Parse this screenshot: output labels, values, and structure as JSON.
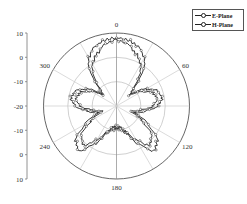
{
  "chart_data": {
    "type": "polar-line",
    "title": "",
    "angular_axis": {
      "direction": "clockwise",
      "zero_location": "top",
      "tick_labels": [
        "0",
        "60",
        "120",
        "180",
        "240",
        "300"
      ],
      "tick_degrees": [
        0,
        60,
        120,
        180,
        240,
        300
      ],
      "spoke_degrees": [
        0,
        30,
        60,
        90,
        120,
        150,
        180,
        210,
        240,
        270,
        300,
        330
      ]
    },
    "radial_axis": {
      "label": "",
      "range": [
        -20,
        10
      ],
      "ring_values": [
        -10,
        0,
        10
      ],
      "left_axis_tick_labels": [
        "10",
        "0",
        "-10",
        "-20",
        "-10",
        "0",
        "10"
      ]
    },
    "legend": {
      "position": "top-right",
      "entries": [
        "E-Plane",
        "H-Plane"
      ]
    },
    "series": [
      {
        "name": "E-Plane",
        "angles_deg": [
          0,
          10,
          20,
          30,
          35,
          40,
          45,
          50,
          60,
          70,
          80,
          90,
          100,
          110,
          120,
          130,
          140,
          150,
          160,
          170,
          180,
          190,
          200,
          210,
          220,
          230,
          240,
          250,
          260,
          270,
          280,
          290,
          300,
          310,
          315,
          320,
          325,
          330,
          340,
          350
        ],
        "values_db": [
          8,
          7.5,
          6,
          3,
          0,
          -5,
          -10,
          -12,
          -6,
          -2,
          -1,
          -3,
          -8,
          -12,
          -5,
          2,
          4,
          -2,
          -8,
          -10,
          -11,
          -10,
          -8,
          -2,
          4,
          2,
          -5,
          -12,
          -8,
          -3,
          -1,
          -2,
          -6,
          -12,
          -10,
          -5,
          0,
          3,
          6,
          7.5
        ]
      },
      {
        "name": "H-Plane",
        "angles_deg": [
          0,
          10,
          20,
          30,
          35,
          40,
          45,
          50,
          60,
          70,
          80,
          90,
          100,
          110,
          120,
          130,
          140,
          150,
          160,
          170,
          180,
          190,
          200,
          210,
          220,
          230,
          240,
          250,
          260,
          270,
          280,
          290,
          300,
          310,
          315,
          320,
          325,
          330,
          340,
          350
        ],
        "values_db": [
          7,
          6,
          3,
          0,
          -3,
          -7,
          -11,
          -13,
          -8,
          -4,
          -3,
          -5,
          -10,
          -14,
          -8,
          -1,
          1,
          -4,
          -9,
          -11,
          -12,
          -11,
          -9,
          -4,
          1,
          -1,
          -8,
          -14,
          -10,
          -5,
          -3,
          -4,
          -8,
          -13,
          -11,
          -7,
          -3,
          0,
          3,
          6
        ]
      }
    ]
  },
  "labels": {
    "angle_0": "0",
    "angle_60": "60",
    "angle_120": "120",
    "angle_180": "180",
    "angle_240": "240",
    "angle_300": "300",
    "r_top_10": "10",
    "r_top_0": "0",
    "r_top_m10": "-10",
    "r_mid_m20": "-20",
    "r_bot_m10": "-10",
    "r_bot_0": "0",
    "r_bot_10": "10",
    "legend_e": "E-Plane",
    "legend_h": "H-Plane"
  }
}
